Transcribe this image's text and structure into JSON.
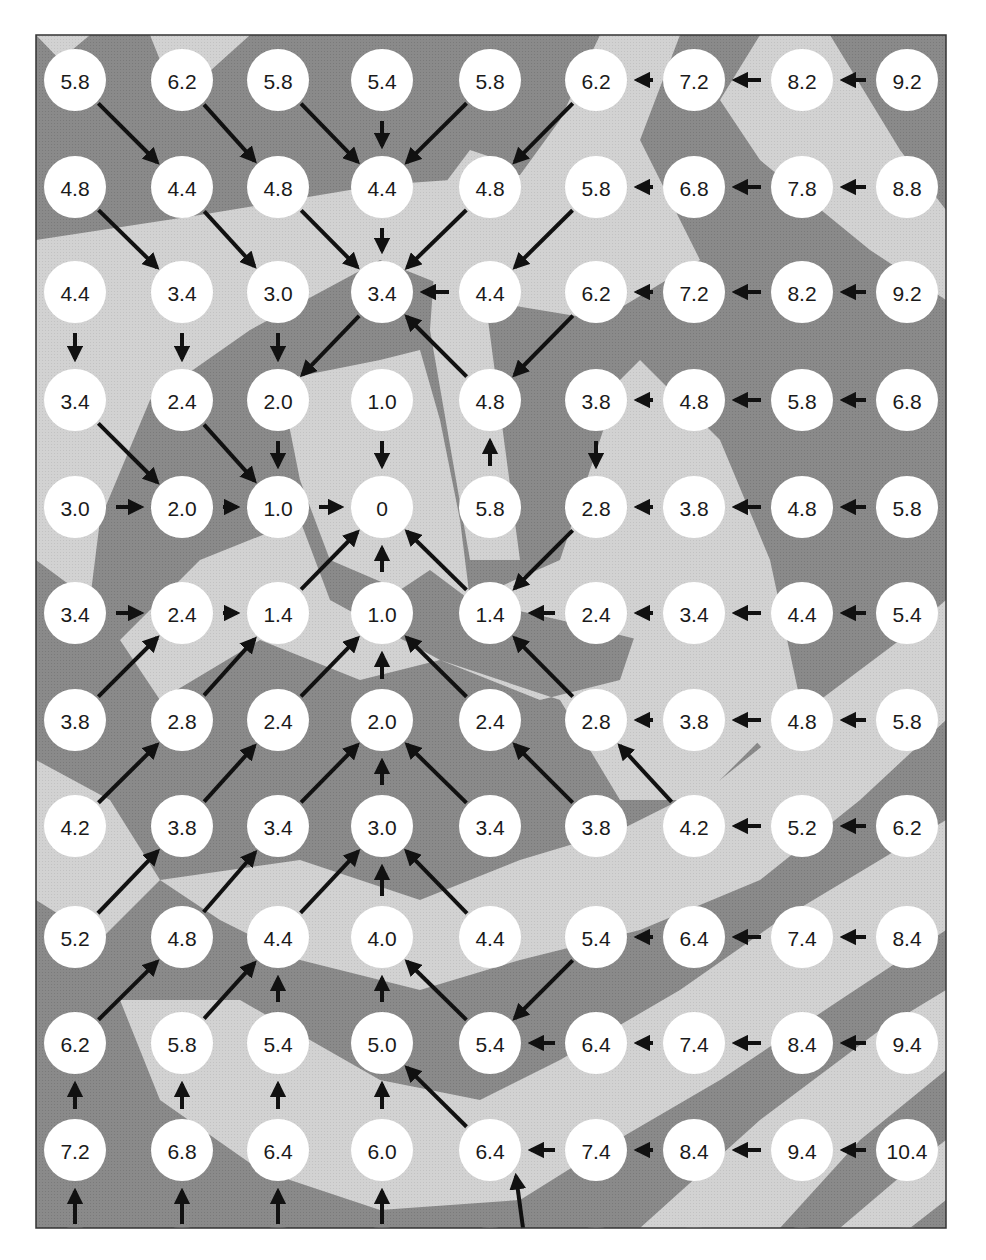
{
  "figure": {
    "colors": {
      "band_dark": "#8c8c8c",
      "band_light": "#cfcfcf",
      "node_fill": "#ffffff",
      "arrow": "#111111",
      "text": "#1a1a1a"
    },
    "grid": {
      "cols": 9,
      "rows": 11,
      "col_x": [
        75,
        182,
        278,
        382,
        490,
        596,
        694,
        802,
        907
      ],
      "row_y": [
        80,
        187,
        292,
        400,
        507,
        613,
        720,
        826,
        937,
        1043,
        1150
      ]
    },
    "values": [
      [
        "5.8",
        "6.2",
        "5.8",
        "5.4",
        "5.8",
        "6.2",
        "7.2",
        "8.2",
        "9.2"
      ],
      [
        "4.8",
        "4.4",
        "4.8",
        "4.4",
        "4.8",
        "5.8",
        "6.8",
        "7.8",
        "8.8"
      ],
      [
        "4.4",
        "3.4",
        "3.0",
        "3.4",
        "4.4",
        "6.2",
        "7.2",
        "8.2",
        "9.2"
      ],
      [
        "3.4",
        "2.4",
        "2.0",
        "1.0",
        "4.8",
        "3.8",
        "4.8",
        "5.8",
        "6.8"
      ],
      [
        "3.0",
        "2.0",
        "1.0",
        "0",
        "5.8",
        "2.8",
        "3.8",
        "4.8",
        "5.8"
      ],
      [
        "3.4",
        "2.4",
        "1.4",
        "1.0",
        "1.4",
        "2.4",
        "3.4",
        "4.4",
        "5.4"
      ],
      [
        "3.8",
        "2.8",
        "2.4",
        "2.0",
        "2.4",
        "2.8",
        "3.8",
        "4.8",
        "5.8"
      ],
      [
        "4.2",
        "3.8",
        "3.4",
        "3.0",
        "3.4",
        "3.8",
        "4.2",
        "5.2",
        "6.2"
      ],
      [
        "5.2",
        "4.8",
        "4.4",
        "4.0",
        "4.4",
        "5.4",
        "6.4",
        "7.4",
        "8.4"
      ],
      [
        "6.2",
        "5.8",
        "5.4",
        "5.0",
        "5.4",
        "6.4",
        "7.4",
        "8.4",
        "9.4"
      ],
      [
        "7.2",
        "6.8",
        "6.4",
        "6.0",
        "6.4",
        "7.4",
        "8.4",
        "9.4",
        "10.4"
      ]
    ],
    "arrows": [
      [
        "SE",
        "SE",
        "SE",
        "S",
        "SW",
        "SW",
        "W",
        "W",
        "W"
      ],
      [
        "SE",
        "SE",
        "SE",
        "S",
        "SW",
        "SW",
        "W",
        "W",
        "W"
      ],
      [
        "S",
        "S",
        "S",
        "SW",
        "W",
        "SW",
        "W",
        "W",
        "W"
      ],
      [
        "SE",
        "SE",
        "S",
        "S",
        "NW",
        "S",
        "W",
        "W",
        "W"
      ],
      [
        "E",
        "E",
        "E",
        "",
        "N",
        "SW",
        "W",
        "W",
        "W"
      ],
      [
        "E",
        "E",
        "NE",
        "N",
        "NW",
        "W",
        "W",
        "W",
        "W"
      ],
      [
        "NE",
        "NE",
        "NE",
        "N",
        "NW",
        "NW",
        "W",
        "W",
        "W"
      ],
      [
        "NE",
        "NE",
        "NE",
        "N",
        "NW",
        "NW",
        "NW",
        "W",
        "W"
      ],
      [
        "NE",
        "NE",
        "NE",
        "N",
        "NW",
        "SW",
        "W",
        "W",
        "W"
      ],
      [
        "NE",
        "NE",
        "N",
        "N",
        "NW",
        "W",
        "W",
        "W",
        "W"
      ],
      [
        "N",
        "N",
        "N",
        "N",
        "NW",
        "W",
        "W",
        "W",
        "W"
      ]
    ],
    "edge_arrows_from_below": [
      "N",
      "N",
      "N",
      "N",
      "NW",
      "",
      "",
      "",
      ""
    ],
    "goal": {
      "row": 4,
      "col": 3,
      "value": "0"
    }
  }
}
